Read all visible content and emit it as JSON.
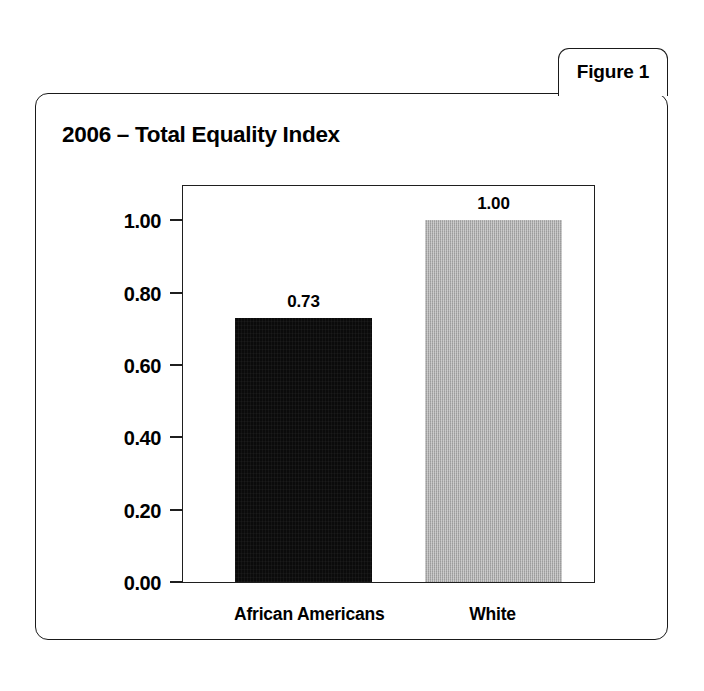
{
  "figure": {
    "tab_label": "Figure 1"
  },
  "chart_data": {
    "type": "bar",
    "title": "2006 – Total Equality Index",
    "categories": [
      "African Americans",
      "White"
    ],
    "values": [
      0.73,
      1.0
    ],
    "value_labels": [
      "0.73",
      "1.00"
    ],
    "series": [
      {
        "name": "Total Equality Index",
        "values": [
          0.73,
          1.0
        ]
      }
    ],
    "xlabel": "",
    "ylabel": "",
    "ylim": [
      0.0,
      1.1
    ],
    "y_ticks": [
      0.0,
      0.2,
      0.4,
      0.6,
      0.8,
      1.0
    ],
    "y_tick_labels": [
      "0.00",
      "0.20",
      "0.40",
      "0.60",
      "0.80",
      "1.00"
    ],
    "grid": false,
    "legend": "none",
    "bar_colors": [
      "#0b0b0b",
      "#a9a9a9"
    ],
    "border_color": "#1f1f1f",
    "background": "#ffffff"
  }
}
